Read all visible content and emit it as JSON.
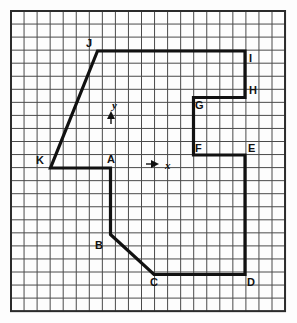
{
  "figure": {
    "background_color": "#fdfdfd",
    "grid": {
      "origin_x": 11,
      "origin_y": 11,
      "cell": 13.05,
      "cols": 21,
      "rows": 23,
      "line_color": "#4a4a4a",
      "line_width": 1,
      "border_color": "#2b2b2b",
      "border_width": 2
    },
    "shape": {
      "stroke_color": "#111111",
      "stroke_width": 3.2,
      "fill": "none",
      "closed": true,
      "points": [
        {
          "label": "A",
          "x": 110.5,
          "y": 168.0
        },
        {
          "label": "B",
          "x": 110.5,
          "y": 234.5
        },
        {
          "label": "C",
          "x": 154.0,
          "y": 274.5
        },
        {
          "label": "D",
          "x": 245.0,
          "y": 274.5
        },
        {
          "label": "E",
          "x": 245.0,
          "y": 155.0
        },
        {
          "label": "F",
          "x": 193.5,
          "y": 155.0
        },
        {
          "label": "G",
          "x": 193.5,
          "y": 97.5
        },
        {
          "label": "H",
          "x": 245.0,
          "y": 97.5
        },
        {
          "label": "I",
          "x": 245.0,
          "y": 51.0
        },
        {
          "label": "J",
          "x": 97.5,
          "y": 51.0
        },
        {
          "label": "K",
          "x": 50.5,
          "y": 168.0
        }
      ]
    },
    "vertex_labels": [
      {
        "name": "A",
        "text": "A",
        "x": 107,
        "y": 154
      },
      {
        "name": "B",
        "text": "B",
        "x": 95,
        "y": 240
      },
      {
        "name": "C",
        "text": "C",
        "x": 150,
        "y": 277
      },
      {
        "name": "D",
        "text": "D",
        "x": 247,
        "y": 277
      },
      {
        "name": "E",
        "text": "E",
        "x": 248,
        "y": 143
      },
      {
        "name": "F",
        "text": "F",
        "x": 195,
        "y": 143
      },
      {
        "name": "G",
        "text": "G",
        "x": 195,
        "y": 100
      },
      {
        "name": "H",
        "text": "H",
        "x": 249,
        "y": 85
      },
      {
        "name": "I",
        "text": "I",
        "x": 249,
        "y": 53
      },
      {
        "name": "J",
        "text": "J",
        "x": 86,
        "y": 38
      },
      {
        "name": "K",
        "text": "K",
        "x": 36,
        "y": 155
      }
    ],
    "axes": [
      {
        "name": "y-axis-marker",
        "label": "y",
        "label_x": 112,
        "label_y": 100,
        "arrow_x": 111,
        "arrow_y": 113,
        "direction": "up",
        "color": "#111111"
      },
      {
        "name": "x-axis-marker",
        "label": "x",
        "label_x": 165,
        "label_y": 160,
        "arrow_x": 152,
        "arrow_y": 164,
        "direction": "right",
        "color": "#111111"
      }
    ]
  }
}
